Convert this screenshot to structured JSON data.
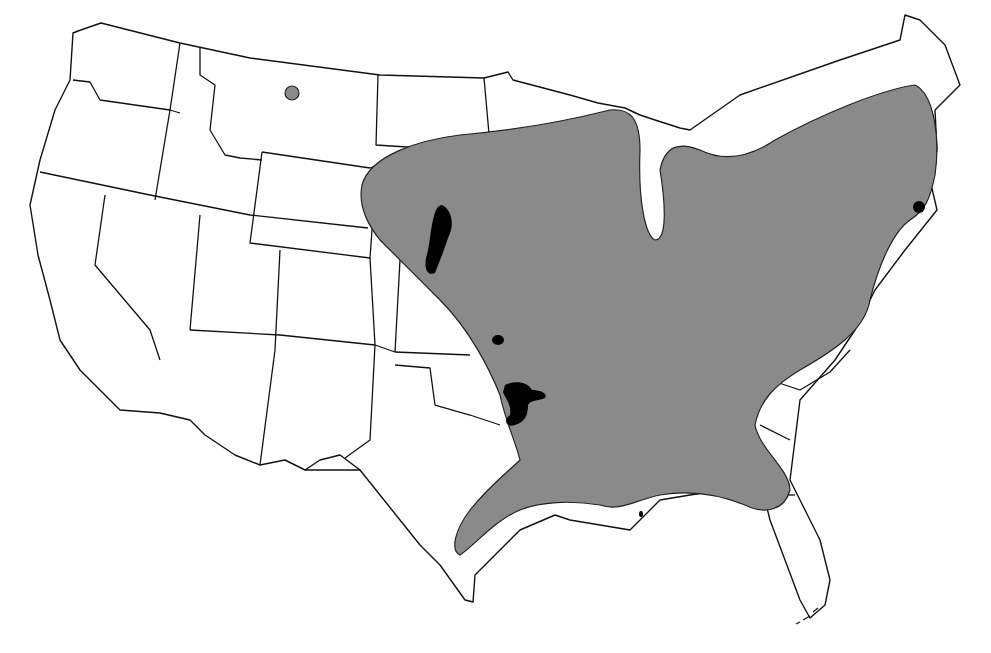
{
  "map": {
    "type": "species-range-map",
    "region": "Contiguous United States",
    "colors": {
      "background": "#ffffff",
      "state_fill": "#ffffff",
      "state_outline": "#111111",
      "range_fill": "#8a8a8a",
      "core_fill": "#000000"
    },
    "layers": [
      {
        "name": "state-boundaries",
        "description": "Outline of lower 48 US states"
      },
      {
        "name": "primary-range",
        "description": "Large gray range covering eastern and central US from the Great Plains to the Atlantic coast and Gulf coast"
      },
      {
        "name": "disjunct-population-montana",
        "description": "Small gray isolated patch in north-central Montana"
      },
      {
        "name": "core-area-nebraska",
        "description": "Black patch in eastern Nebraska / Platte region"
      },
      {
        "name": "core-area-kansas",
        "description": "Small black dot in Kansas"
      },
      {
        "name": "core-area-oklahoma-texas",
        "description": "Black patch near Oklahoma/Texas border"
      },
      {
        "name": "core-area-new-jersey",
        "description": "Black dot on New Jersey / Delaware coast"
      },
      {
        "name": "core-area-louisiana-coast",
        "description": "Tiny black dot off Louisiana coast"
      }
    ]
  }
}
